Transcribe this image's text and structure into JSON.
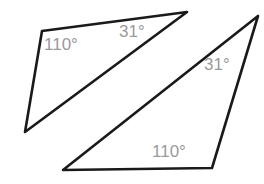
{
  "figure": {
    "background_color": "#ffffff",
    "stroke_color": "#1a1a1a",
    "label_color": "#9a9a9a",
    "width": 264,
    "height": 184
  },
  "shapes": [
    {
      "name": "left-triangle",
      "points": "42,31 187,12 25,132",
      "labels": [
        {
          "text": "110°",
          "x": 44,
          "y": 36
        },
        {
          "text": "31°",
          "x": 119,
          "y": 23
        }
      ]
    },
    {
      "name": "right-triangle",
      "points": "258,16 212,168 63,170",
      "labels": [
        {
          "text": "31°",
          "x": 204,
          "y": 56
        },
        {
          "text": "110°",
          "x": 152,
          "y": 143
        }
      ]
    }
  ],
  "labels": {
    "left_obtuse": "110°",
    "left_acute": "31°",
    "right_acute": "31°",
    "right_obtuse": "110°"
  }
}
